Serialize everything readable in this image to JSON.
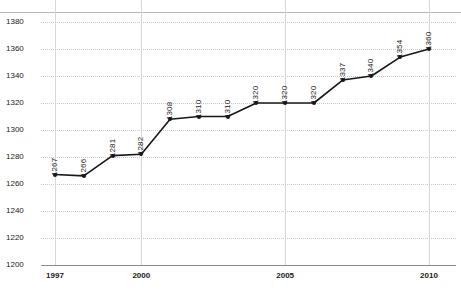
{
  "chart_data": {
    "type": "line",
    "title": "",
    "xlabel": "",
    "ylabel": "",
    "ylim": [
      1200,
      1380
    ],
    "ytick_step": 20,
    "yticks": [
      "1380",
      "1360",
      "1340",
      "1320",
      "1300",
      "1280",
      "1260",
      "1240",
      "1220",
      "1200"
    ],
    "xticks": [
      "1997",
      "2000",
      "2005",
      "2010"
    ],
    "xlim": [
      1997,
      2010
    ],
    "grid": true,
    "legend": "none",
    "categories": [
      1997,
      1998,
      1999,
      2000,
      2001,
      2002,
      2003,
      2004,
      2005,
      2006,
      2007,
      2008,
      2009,
      2010
    ],
    "values": [
      1267,
      1266,
      1281,
      1282,
      1308,
      1310,
      1310,
      1320,
      1320,
      1320,
      1337,
      1340,
      1354,
      1360
    ],
    "point_labels": [
      "1267",
      "1266",
      "1281",
      "1282",
      "1308",
      "1310",
      "1310",
      "1320",
      "1320",
      "1320",
      "1337",
      "1340",
      "1354",
      "1360"
    ],
    "series": [
      {
        "name": "series-1",
        "values": [
          1267,
          1266,
          1281,
          1282,
          1308,
          1310,
          1310,
          1320,
          1320,
          1320,
          1337,
          1340,
          1354,
          1360
        ]
      }
    ],
    "colors": {
      "line": "#171717",
      "marker": "#171717",
      "grid": "#c8c8c8",
      "axis": "#8a8a8a",
      "text": "#1a1a1a",
      "background": "#ffffff"
    }
  }
}
